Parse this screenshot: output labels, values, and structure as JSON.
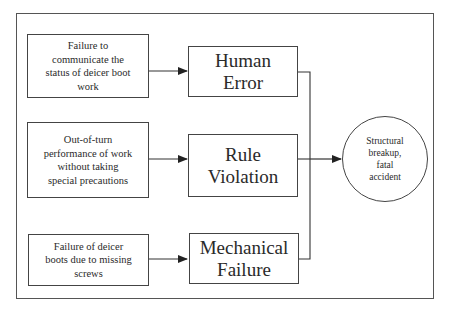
{
  "diagram": {
    "type": "fault-tree / cause-effect flow",
    "causes": [
      {
        "id": "cause-1",
        "label": "Failure to\ncommunicate the\nstatus of deicer boot\nwork"
      },
      {
        "id": "cause-2",
        "label": "Out-of-turn\nperformance of work\nwithout taking\nspecial precautions"
      },
      {
        "id": "cause-3",
        "label": "Failure of deicer\nboots due to missing\nscrews"
      }
    ],
    "categories": [
      {
        "id": "cat-1",
        "label": "Human\nError"
      },
      {
        "id": "cat-2",
        "label": "Rule\nViolation"
      },
      {
        "id": "cat-3",
        "label": "Mechanical\nFailure"
      }
    ],
    "outcome": {
      "label": "Structural\nbreakup,\nfatal\naccident"
    },
    "edges": [
      {
        "from": "cause-1",
        "to": "cat-1"
      },
      {
        "from": "cause-2",
        "to": "cat-2"
      },
      {
        "from": "cause-3",
        "to": "cat-3"
      },
      {
        "from": "cat-1",
        "to": "outcome"
      },
      {
        "from": "cat-2",
        "to": "outcome"
      },
      {
        "from": "cat-3",
        "to": "outcome"
      }
    ],
    "colors": {
      "line": "#444444",
      "background": "#ffffff",
      "text": "#2a2a2a"
    }
  }
}
